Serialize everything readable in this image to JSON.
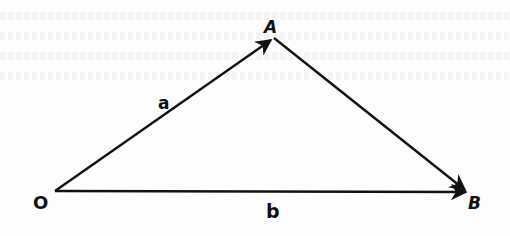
{
  "diagram": {
    "type": "vector-triangle",
    "colors": {
      "ink": "#111111",
      "paper": "#fdfdfd"
    },
    "points": {
      "O": {
        "label": "O",
        "x": 55,
        "y": 191
      },
      "A": {
        "label": "A",
        "x": 273,
        "y": 38
      },
      "B": {
        "label": "B",
        "x": 468,
        "y": 192
      }
    },
    "vectors": [
      {
        "id": "a",
        "label": "a",
        "from": "O",
        "to": "A",
        "arrowhead": "at-end"
      },
      {
        "id": "b",
        "label": "b",
        "from": "O",
        "to": "B",
        "arrowhead": "at-end"
      },
      {
        "id": "AB",
        "label": "",
        "from": "A",
        "to": "B",
        "arrowhead": "at-end"
      }
    ],
    "labels": {
      "O": "O",
      "A": "A",
      "B": "B",
      "a": "a",
      "b": "b"
    }
  }
}
